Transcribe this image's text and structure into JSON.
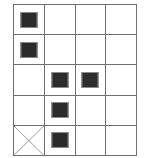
{
  "figure": {
    "name": "grid-marker-diagram",
    "columns": 4,
    "rows": 5,
    "grid_line_color": "#6e6e6e",
    "background_color": "#ffffff",
    "marker_fill_color": "#2b2b2b",
    "marker_outline_color": "#8a8a8a",
    "cross_color": "#9a9a9a",
    "cells": [
      [
        {
          "marker": "filled-square",
          "label": ""
        },
        {
          "marker": "none",
          "label": ""
        },
        {
          "marker": "none",
          "label": ""
        },
        {
          "marker": "none",
          "label": ""
        }
      ],
      [
        {
          "marker": "filled-square",
          "label": ""
        },
        {
          "marker": "none",
          "label": ""
        },
        {
          "marker": "none",
          "label": ""
        },
        {
          "marker": "none",
          "label": ""
        }
      ],
      [
        {
          "marker": "none",
          "label": ""
        },
        {
          "marker": "filled-square",
          "label": ""
        },
        {
          "marker": "filled-square",
          "label": ""
        },
        {
          "marker": "none",
          "label": ""
        }
      ],
      [
        {
          "marker": "none",
          "label": ""
        },
        {
          "marker": "filled-square",
          "label": ""
        },
        {
          "marker": "none",
          "label": ""
        },
        {
          "marker": "none",
          "label": ""
        }
      ],
      [
        {
          "marker": "cross",
          "label": ""
        },
        {
          "marker": "filled-square",
          "label": ""
        },
        {
          "marker": "none",
          "label": ""
        },
        {
          "marker": "none",
          "label": ""
        }
      ]
    ]
  }
}
